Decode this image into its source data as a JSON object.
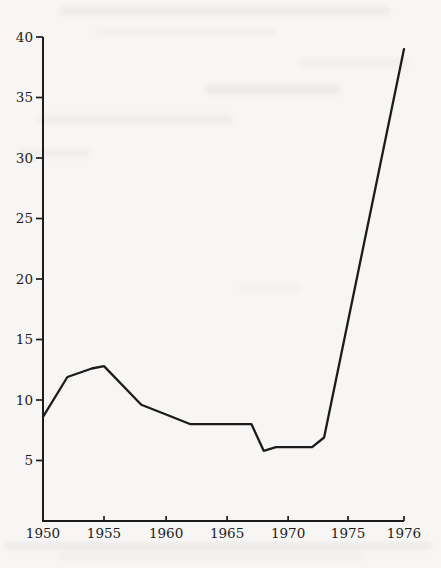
{
  "figure": {
    "background_color": "#f7f6f4",
    "line_color": "#1c1c1c",
    "axis_color": "#1c1c1c",
    "label_color": "#1b1b1b"
  },
  "chart_data": {
    "type": "line",
    "title": "",
    "xlabel": "",
    "ylabel": "",
    "series": [
      {
        "name": "value",
        "points": [
          {
            "year": 1950,
            "value": 8.6
          },
          {
            "year": 1952,
            "value": 11.9
          },
          {
            "year": 1954,
            "value": 12.6
          },
          {
            "year": 1955,
            "value": 12.8
          },
          {
            "year": 1958,
            "value": 9.6
          },
          {
            "year": 1960,
            "value": 8.8
          },
          {
            "year": 1962,
            "value": 8.0
          },
          {
            "year": 1967,
            "value": 8.0
          },
          {
            "year": 1968,
            "value": 5.8
          },
          {
            "year": 1969,
            "value": 6.1
          },
          {
            "year": 1972,
            "value": 6.1
          },
          {
            "year": 1973,
            "value": 6.9
          },
          {
            "year": 1976,
            "value": 39.0
          }
        ]
      }
    ],
    "x_ticks": [
      {
        "label": "1950",
        "year": 1950,
        "axis_frac": 0.0
      },
      {
        "label": "1955",
        "year": 1955,
        "axis_frac": 0.169
      },
      {
        "label": "1960",
        "year": 1960,
        "axis_frac": 0.341
      },
      {
        "label": "1965",
        "year": 1965,
        "axis_frac": 0.51
      },
      {
        "label": "1970",
        "year": 1970,
        "axis_frac": 0.679
      },
      {
        "label": "1975",
        "year": 1975,
        "axis_frac": 0.845
      },
      {
        "label": "1976",
        "year": 1976,
        "axis_frac": 1.0
      }
    ],
    "y_ticks": [
      {
        "label": "5",
        "value": 5
      },
      {
        "label": "10",
        "value": 10
      },
      {
        "label": "15",
        "value": 15
      },
      {
        "label": "20",
        "value": 20
      },
      {
        "label": "25",
        "value": 25
      },
      {
        "label": "30",
        "value": 30
      },
      {
        "label": "35",
        "value": 35
      },
      {
        "label": "40",
        "value": 40
      }
    ],
    "ylim": [
      0,
      40
    ],
    "grid": false,
    "legend": null,
    "axis_note": "x-axis is non-linear at right end: 1976 is drawn a full five-year interval after 1975"
  }
}
